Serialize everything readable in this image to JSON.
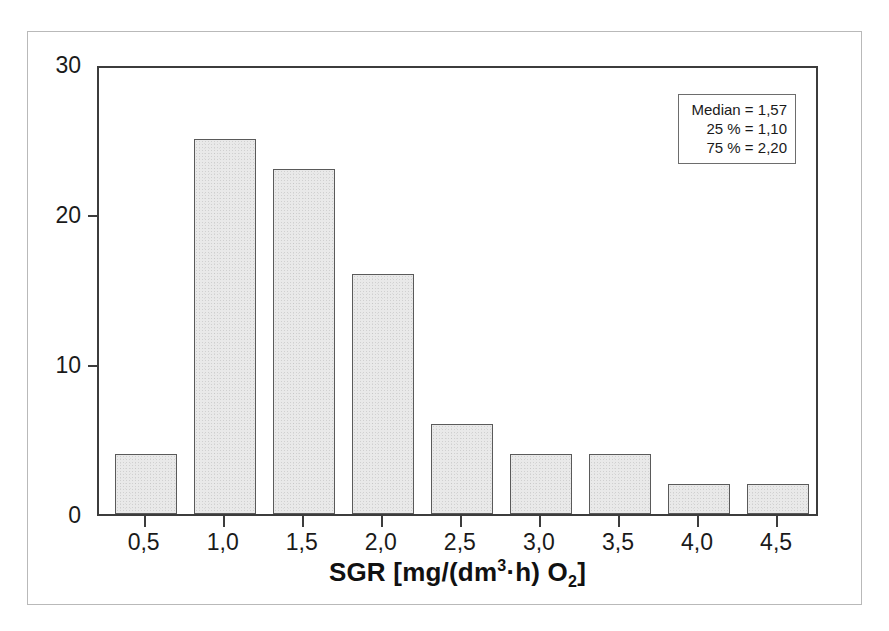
{
  "chart_data": {
    "type": "bar",
    "title": "",
    "subtitle": "",
    "xlabel": "SGR [mg/(dm³·h) O₂]",
    "ylabel": "",
    "categories": [
      "0,5",
      "1,0",
      "1,5",
      "2,0",
      "2,5",
      "3,0",
      "3,5",
      "4,0",
      "4,5"
    ],
    "values": [
      4,
      25,
      23,
      16,
      6,
      4,
      4,
      2,
      2
    ],
    "ylim": [
      0,
      30
    ],
    "yticks": [
      0,
      10,
      20,
      30
    ],
    "ytick_labels": [
      "0",
      "10",
      "20",
      "30"
    ],
    "xlim": [
      0.25,
      4.75
    ],
    "grid": false,
    "legend": "none",
    "annotations": {
      "median_label": "Median = 1,57",
      "p25_label": "25 % = 1,10",
      "p75_label": "75 % = 2,20"
    },
    "colors": {
      "bar_fill": "#e9e9e9",
      "bar_edge": "#5a5a5a",
      "axis": "#3c3c3c",
      "text": "#1a1a1a",
      "outer_frame": "#b9b9b9",
      "stats_box_border": "#6d6d6d"
    }
  },
  "axis": {
    "x_title_parts": {
      "main": "SGR [mg/(dm",
      "sup": "3",
      "mid": "·h) O",
      "sub": "2",
      "end": "]"
    }
  },
  "stats": {
    "median": "Median = 1,57",
    "p25": "25 % = 1,10",
    "p75": "75 % = 2,20"
  }
}
